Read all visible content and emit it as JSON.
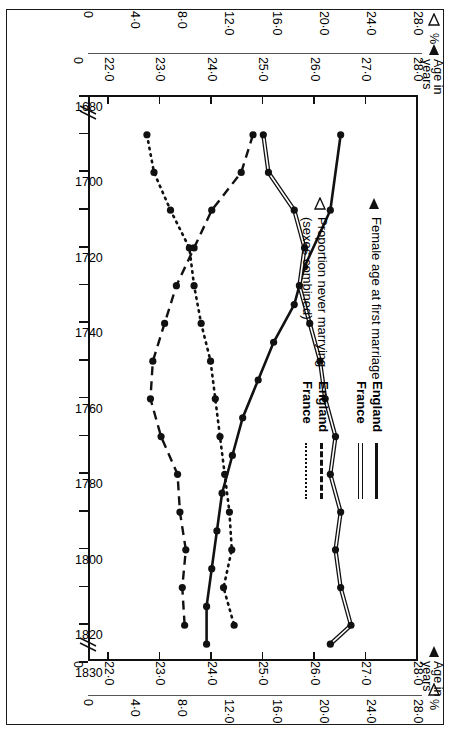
{
  "figure": {
    "orientation": "rotated-90-clockwise",
    "frame_color": "#1a1a1a"
  },
  "legend": {
    "groups": [
      {
        "marker": "filled-triangle",
        "heading_line1": "Female age at first marriage",
        "heading_line2": "",
        "entries": [
          {
            "name": "England",
            "style": "solid"
          },
          {
            "name": "France",
            "style": "double"
          }
        ]
      },
      {
        "marker": "open-triangle",
        "heading_line1": "Proportion never marrying",
        "heading_line2": "(sexes combined)",
        "entries": [
          {
            "name": "England",
            "style": "dashed"
          },
          {
            "name": "France",
            "style": "dotted"
          }
        ]
      }
    ]
  },
  "axes": {
    "left": {
      "pct_caption": "%",
      "pct_marker": "open-triangle",
      "age_caption_line1": "Age in",
      "age_caption_line2": "years",
      "age_marker": "filled-triangle",
      "pct_ticks": [
        "28·0",
        "24·0",
        "20·0",
        "16·0",
        "12·0",
        "8·0",
        "4·0",
        "0"
      ],
      "age_ticks": [
        "28·0",
        "27·0",
        "26·0",
        "25·0",
        "24·0",
        "23·0",
        "22·0",
        "0"
      ]
    },
    "right": {
      "pct_caption": "%",
      "pct_marker": "open-triangle",
      "age_caption_line1": "Age in",
      "age_caption_line2": "years",
      "age_marker": "filled-triangle",
      "pct_ticks": [
        "28·0",
        "24·0",
        "20·0",
        "16·0",
        "12·0",
        "8·0",
        "4·0",
        "0"
      ],
      "age_ticks": [
        "28·0",
        "27·0",
        "26·0",
        "25·0",
        "24·0",
        "23·0",
        "22·0",
        "0"
      ]
    },
    "x_labels": [
      "1680",
      "1700",
      "1720",
      "1740",
      "1760",
      "1780",
      "1800",
      "1820",
      "1830"
    ],
    "x_label_years": [
      1680,
      1700,
      1720,
      1740,
      1760,
      1780,
      1800,
      1820,
      1830
    ]
  },
  "chart_data": {
    "type": "line",
    "title": "",
    "subtitle": "",
    "xlabel": "",
    "ylabel": "Age in years / %",
    "xlim": [
      1680,
      1830
    ],
    "x_tick_step": 10,
    "grid": false,
    "legend_position": "inside-upper-left",
    "axis_break_at_left": true,
    "axis_break_at_right": true,
    "y_left_axis": {
      "name": "Age in years",
      "ticks": [
        22.0,
        23.0,
        24.0,
        25.0,
        26.0,
        27.0,
        28.0
      ],
      "lim": [
        21.6,
        28.0
      ],
      "marker": "filled-triangle"
    },
    "y_right_axis": {
      "name": "%",
      "ticks": [
        0,
        4.0,
        8.0,
        12.0,
        16.0,
        20.0,
        24.0,
        28.0
      ],
      "lim": [
        0,
        28.0
      ],
      "marker": "open-triangle"
    },
    "series": [
      {
        "name": "England",
        "group": "Female age at first marriage",
        "axis": "age",
        "style": "solid",
        "x": [
          1690,
          1710,
          1725,
          1735,
          1745,
          1755,
          1765,
          1775,
          1785,
          1795,
          1805,
          1815,
          1825
        ],
        "values": [
          26.5,
          26.3,
          25.8,
          25.6,
          25.2,
          24.9,
          24.6,
          24.4,
          24.2,
          24.1,
          24.0,
          23.9,
          23.9
        ]
      },
      {
        "name": "France",
        "group": "Female age at first marriage",
        "axis": "age",
        "style": "double",
        "x": [
          1690,
          1700,
          1710,
          1720,
          1730,
          1740,
          1750,
          1760,
          1770,
          1780,
          1790,
          1800,
          1810,
          1820,
          1825
        ],
        "values": [
          25.0,
          25.1,
          25.6,
          25.8,
          25.7,
          25.9,
          26.1,
          26.2,
          26.4,
          26.3,
          26.5,
          26.4,
          26.5,
          26.7,
          26.3
        ]
      },
      {
        "name": "England",
        "group": "Proportion never marrying",
        "axis": "pct",
        "style": "dashed",
        "x": [
          1690,
          1700,
          1710,
          1720,
          1730,
          1740,
          1750,
          1760,
          1770,
          1780,
          1790,
          1800,
          1810,
          1820
        ],
        "values": [
          14.0,
          13.0,
          10.5,
          9.0,
          7.5,
          6.5,
          5.5,
          5.3,
          6.2,
          7.6,
          7.8,
          8.3,
          8.0,
          8.2
        ]
      },
      {
        "name": "France",
        "group": "Proportion never marrying",
        "axis": "pct",
        "style": "dotted",
        "x": [
          1690,
          1700,
          1710,
          1720,
          1730,
          1740,
          1750,
          1760,
          1770,
          1780,
          1790,
          1800,
          1810,
          1820
        ],
        "values": [
          5.0,
          5.6,
          7.0,
          8.6,
          9.0,
          9.6,
          10.4,
          10.8,
          11.2,
          11.6,
          12.0,
          12.2,
          11.5,
          12.4
        ]
      }
    ]
  }
}
